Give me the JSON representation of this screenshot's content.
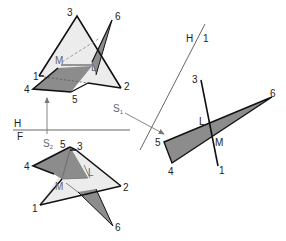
{
  "diagram": {
    "type": "descriptive-geometry-intersection-of-planes",
    "colors": {
      "triangle_123_fill": "#ececec",
      "triangle_456_fill": "#8c8c8c",
      "edge": "#111111",
      "construction": "#777777"
    },
    "fold_lines": {
      "hf": {
        "upper_label": "H",
        "lower_label": "F"
      },
      "h1": {
        "label_left": "H",
        "label_right": "1"
      }
    },
    "sight_arrows": {
      "s1": {
        "label": "S",
        "subscript": "1"
      },
      "s2": {
        "label": "S",
        "subscript": "2"
      }
    },
    "top_view": {
      "vertices": [
        {
          "id": "1",
          "label": "1"
        },
        {
          "id": "2",
          "label": "2"
        },
        {
          "id": "3",
          "label": "3"
        },
        {
          "id": "4",
          "label": "4"
        },
        {
          "id": "5",
          "label": "5"
        },
        {
          "id": "6",
          "label": "6"
        }
      ],
      "intersection_points": [
        {
          "id": "M",
          "label": "M"
        },
        {
          "id": "L",
          "label": "L"
        }
      ]
    },
    "front_view": {
      "vertices": [
        {
          "id": "1",
          "label": "1"
        },
        {
          "id": "2",
          "label": "2"
        },
        {
          "id": "3",
          "label": "3"
        },
        {
          "id": "4",
          "label": "4"
        },
        {
          "id": "5",
          "label": "5"
        },
        {
          "id": "6",
          "label": "6"
        }
      ],
      "intersection_points": [
        {
          "id": "M",
          "label": "M"
        },
        {
          "id": "L",
          "label": "L"
        }
      ]
    },
    "auxiliary_view": {
      "vertices": [
        {
          "id": "3",
          "label": "3"
        },
        {
          "id": "1",
          "label": "1"
        },
        {
          "id": "4",
          "label": "4"
        },
        {
          "id": "5",
          "label": "5"
        },
        {
          "id": "6",
          "label": "6"
        }
      ],
      "intersection_points": [
        {
          "id": "L",
          "label": "L"
        },
        {
          "id": "M",
          "label": "M"
        }
      ]
    }
  }
}
